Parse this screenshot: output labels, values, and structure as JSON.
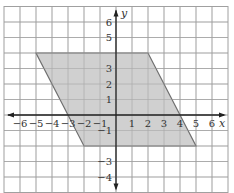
{
  "chart_data": {
    "type": "diagram",
    "title": "",
    "xlabel": "x",
    "ylabel": "y",
    "xlim": [
      -7,
      7
    ],
    "ylim": [
      -5,
      7
    ],
    "grid": true,
    "x_ticks": [
      -6,
      -5,
      -4,
      -3,
      -2,
      -1,
      1,
      2,
      3,
      4,
      5,
      6
    ],
    "x_tick_labels": [
      "−6",
      "−5",
      "−4",
      "−3",
      "−2",
      "−1",
      "1",
      "2",
      "3",
      "4",
      "5",
      "6"
    ],
    "y_ticks": [
      6,
      5,
      3,
      2,
      1,
      -1,
      -3,
      -4
    ],
    "y_tick_labels": [
      "6",
      "5",
      "3",
      "2",
      "1",
      "−1",
      "−3",
      "−4"
    ],
    "shapes": [
      {
        "name": "parallelogram",
        "fill": "#c8c8c8",
        "stroke": "#707070",
        "vertices": [
          [
            -5,
            4
          ],
          [
            2,
            4
          ],
          [
            5,
            -2
          ],
          [
            -2,
            -2
          ]
        ]
      }
    ]
  },
  "style": {
    "grid_color": "#a0a0a0",
    "axis_color": "#222222",
    "fill_color": "#c8c8c8",
    "edge_color": "#707070"
  }
}
